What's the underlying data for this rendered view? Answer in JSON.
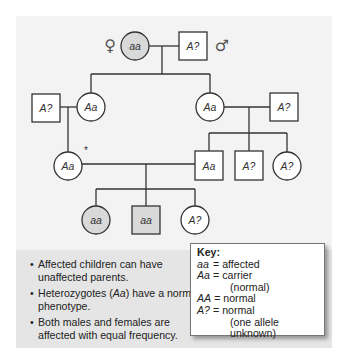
{
  "figure": {
    "sex_symbols": {
      "female": "♀",
      "male": "♂"
    },
    "colors": {
      "panel_top": "#f3f3f3",
      "panel_bottom": "#e5e5e5",
      "affected_fill": "#d9d9d9",
      "unaffected_fill": "#ffffff",
      "line": "#333333"
    },
    "generations": [
      {
        "id": "I",
        "individuals": [
          {
            "id": "I-1",
            "sex": "female",
            "genotype": "aa",
            "affected": true
          },
          {
            "id": "I-2",
            "sex": "male",
            "genotype": "A?",
            "affected": false
          }
        ]
      },
      {
        "id": "II",
        "individuals": [
          {
            "id": "II-1",
            "sex": "male",
            "genotype": "A?",
            "affected": false,
            "married_in": true
          },
          {
            "id": "II-2",
            "sex": "female",
            "genotype": "Aa",
            "affected": false
          },
          {
            "id": "II-3",
            "sex": "female",
            "genotype": "Aa",
            "affected": false
          },
          {
            "id": "II-4",
            "sex": "male",
            "genotype": "A?",
            "affected": false,
            "married_in": true
          }
        ]
      },
      {
        "id": "III",
        "individuals": [
          {
            "id": "III-1",
            "sex": "female",
            "genotype": "Aa",
            "affected": false,
            "marker": "*"
          },
          {
            "id": "III-2",
            "sex": "male",
            "genotype": "Aa",
            "affected": false
          },
          {
            "id": "III-3",
            "sex": "male",
            "genotype": "A?",
            "affected": false
          },
          {
            "id": "III-4",
            "sex": "female",
            "genotype": "A?",
            "affected": false
          }
        ]
      },
      {
        "id": "IV",
        "individuals": [
          {
            "id": "IV-1",
            "sex": "female",
            "genotype": "aa",
            "affected": true
          },
          {
            "id": "IV-2",
            "sex": "male",
            "genotype": "aa",
            "affected": true
          },
          {
            "id": "IV-3",
            "sex": "female",
            "genotype": "A?",
            "affected": false
          }
        ]
      }
    ],
    "marker_label": "*"
  },
  "notes": [
    {
      "bullet": "•",
      "before": "Affected children can have unaffected parents.",
      "italic": "",
      "after": ""
    },
    {
      "bullet": "•",
      "before": "Heterozygotes (",
      "italic": "Aa",
      "after": ") have a normal phenotype."
    },
    {
      "bullet": "•",
      "before": "Both males and females are affected with equal frequency.",
      "italic": "",
      "after": ""
    }
  ],
  "key": {
    "title": "Key:",
    "rows": [
      {
        "genotype": "aa",
        "eq": "=",
        "meaning": "affected",
        "sub": ""
      },
      {
        "genotype": "Aa",
        "eq": "=",
        "meaning": "carrier",
        "sub": "(normal)"
      },
      {
        "genotype": "AA",
        "eq": "=",
        "meaning": "normal",
        "sub": ""
      },
      {
        "genotype": "A?",
        "eq": "=",
        "meaning": "normal",
        "sub": "(one allele unknown)"
      }
    ]
  }
}
